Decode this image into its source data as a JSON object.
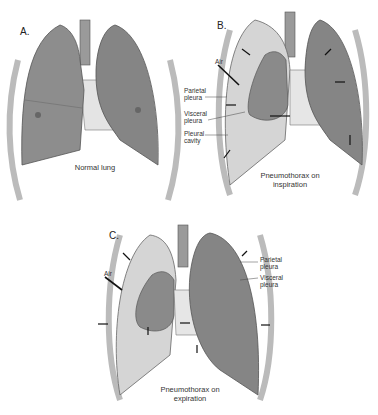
{
  "figure": {
    "panels": [
      {
        "id": "A",
        "letter": "A.",
        "caption": "Normal lung",
        "labels": []
      },
      {
        "id": "B",
        "letter": "B.",
        "caption_line1": "Pneumothorax on",
        "caption_line2": "inspiration",
        "labels": {
          "air": "Air",
          "parietal_1": "Parietal",
          "parietal_2": "pleura",
          "visceral_1": "Visceral",
          "visceral_2": "pleura",
          "pleural_1": "Pleural",
          "pleural_2": "cavity"
        }
      },
      {
        "id": "C",
        "letter": "C.",
        "caption_line1": "Pneumothorax on",
        "caption_line2": "expiration",
        "labels": {
          "air": "Air",
          "parietal_1": "Parietal",
          "parietal_2": "pleura",
          "visceral_1": "Visceral",
          "visceral_2": "pleura"
        }
      }
    ],
    "colors": {
      "lung": "#8a8a8a",
      "lung_dark": "#6f6f6f",
      "pleural_space": "#d9d9d9",
      "rib": "#bdbdbd",
      "heart": "#e6e6e6",
      "outline": "#555555"
    }
  }
}
